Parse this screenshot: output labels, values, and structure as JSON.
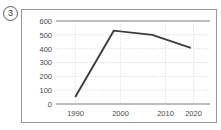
{
  "item": {
    "number": "3"
  },
  "chart_data": {
    "type": "line",
    "title": "",
    "subtitle": "",
    "xlabel": "",
    "ylabel": "",
    "x": [
      1990,
      2000,
      2010,
      2020
    ],
    "categories": [
      "1990",
      "2000",
      "2010",
      "2020"
    ],
    "values": [
      50,
      530,
      500,
      405
    ],
    "series": [
      {
        "name": "",
        "values": [
          50,
          530,
          500,
          405
        ]
      }
    ],
    "xlim": [
      1985,
      2025
    ],
    "ylim": [
      0,
      600
    ],
    "y_ticks": [
      0,
      100,
      200,
      300,
      400,
      500,
      600
    ],
    "y_tick_labels": [
      "0",
      "100",
      "200",
      "300",
      "400",
      "500",
      "600"
    ],
    "x_ticks": [
      1990,
      2000,
      2010,
      2020
    ],
    "x_tick_labels": [
      "1990",
      "2000",
      "2010",
      "2020"
    ],
    "grid": true,
    "grid_style": "dotted",
    "legend": false,
    "legend_position": "none",
    "line_color": "#3c3c3c",
    "grid_color": "#c9c9c9",
    "axis_color": "#7d7d7d",
    "annotations": []
  }
}
